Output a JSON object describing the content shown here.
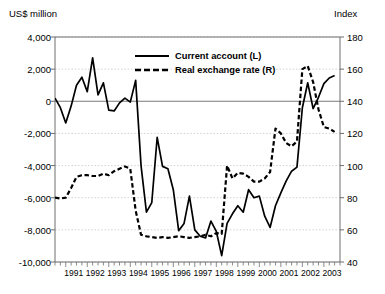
{
  "chart_data": {
    "type": "line",
    "title": "",
    "xlabel": "",
    "ylabel": "US$ million",
    "y2label": "Index",
    "ylim": [
      -10000,
      4000
    ],
    "y2lim": [
      40,
      180
    ],
    "grid": true,
    "legend_position": "top-center",
    "y_ticks": [
      "4,000",
      "2,000",
      "0",
      "-2,000",
      "-4,000",
      "-6,000",
      "-8,000",
      "-10,000"
    ],
    "y_tick_values": [
      4000,
      2000,
      0,
      -2000,
      -4000,
      -6000,
      -8000,
      -10000
    ],
    "y2_ticks": [
      "180",
      "160",
      "140",
      "120",
      "100",
      "80",
      "60",
      "40"
    ],
    "y2_tick_values": [
      180,
      160,
      140,
      120,
      100,
      80,
      60,
      40
    ],
    "x_ticks": [
      "1991",
      "1992",
      "1993",
      "1994",
      "1995",
      "1996",
      "1997",
      "1998",
      "1999",
      "2000",
      "2001",
      "2002",
      "2003"
    ],
    "x_tick_values": [
      1991,
      1992,
      1993,
      1994,
      1995,
      1996,
      1997,
      1998,
      1999,
      2000,
      2001,
      2002,
      2003
    ],
    "x_minor_interval": 0.25,
    "xlim": [
      1990.5,
      2003.75
    ],
    "series": [
      {
        "name": "Current account (L)",
        "axis": "left",
        "style": "solid",
        "color": "#000000",
        "x": [
          1990.5,
          1990.75,
          1991.0,
          1991.25,
          1991.5,
          1991.75,
          1992.0,
          1992.25,
          1992.5,
          1992.75,
          1993.0,
          1993.25,
          1993.5,
          1993.75,
          1994.0,
          1994.25,
          1994.5,
          1994.75,
          1995.0,
          1995.25,
          1995.5,
          1995.75,
          1996.0,
          1996.25,
          1996.5,
          1996.75,
          1997.0,
          1997.25,
          1997.5,
          1997.75,
          1998.0,
          1998.25,
          1998.5,
          1998.75,
          1999.0,
          1999.25,
          1999.5,
          1999.75,
          2000.0,
          2000.25,
          2000.5,
          2000.75,
          2001.0,
          2001.25,
          2001.5,
          2001.75,
          2002.0,
          2002.25,
          2002.5,
          2002.75,
          2003.0,
          2003.25,
          2003.5
        ],
        "y": [
          200,
          -400,
          -1350,
          -300,
          1000,
          1500,
          600,
          2700,
          400,
          1150,
          -550,
          -600,
          -100,
          200,
          -50,
          1300,
          -4000,
          -6900,
          -6300,
          -2250,
          -4050,
          -4200,
          -5500,
          -8050,
          -7600,
          -5900,
          -8000,
          -8400,
          -8500,
          -7450,
          -8100,
          -9600,
          -7600,
          -7000,
          -6500,
          -6900,
          -5500,
          -6000,
          -5900,
          -7150,
          -7850,
          -6500,
          -5700,
          -4950,
          -4350,
          -4100,
          -400,
          1150,
          -450,
          250,
          1100,
          1450,
          1600
        ]
      },
      {
        "name": "Real exchange rate (R)",
        "axis": "right",
        "style": "dashed",
        "color": "#000000",
        "x": [
          1990.5,
          1990.75,
          1991.0,
          1991.25,
          1991.5,
          1991.75,
          1992.0,
          1992.25,
          1992.5,
          1992.75,
          1993.0,
          1993.25,
          1993.5,
          1993.75,
          1994.0,
          1994.25,
          1994.5,
          1994.75,
          1995.0,
          1995.25,
          1995.5,
          1995.75,
          1996.0,
          1996.25,
          1996.5,
          1996.75,
          1997.0,
          1997.25,
          1997.5,
          1997.75,
          1998.0,
          1998.25,
          1998.5,
          1998.75,
          1999.0,
          1999.25,
          1999.5,
          1999.75,
          2000.0,
          2000.25,
          2000.5,
          2000.75,
          2001.0,
          2001.25,
          2001.5,
          2001.75,
          2002.0,
          2002.25,
          2002.5,
          2002.75,
          2003.0,
          2003.25,
          2003.5
        ],
        "y": [
          80,
          79.5,
          80,
          86,
          93,
          94,
          94,
          93.5,
          93.5,
          95,
          94,
          96.5,
          98,
          99.5,
          98,
          72,
          57,
          56,
          55.5,
          55,
          55.5,
          55,
          55.5,
          56,
          55.5,
          55,
          55.5,
          56,
          57,
          56,
          58,
          57.5,
          100,
          92,
          95.5,
          95,
          93,
          90,
          90,
          92,
          96,
          123,
          120,
          114,
          112,
          115,
          160,
          162,
          152,
          135,
          124,
          123,
          121
        ]
      }
    ]
  },
  "legend": {
    "items": [
      {
        "label": "Current account (L)",
        "style": "solid"
      },
      {
        "label": "Real exchange rate (R)",
        "style": "dashed"
      }
    ]
  }
}
